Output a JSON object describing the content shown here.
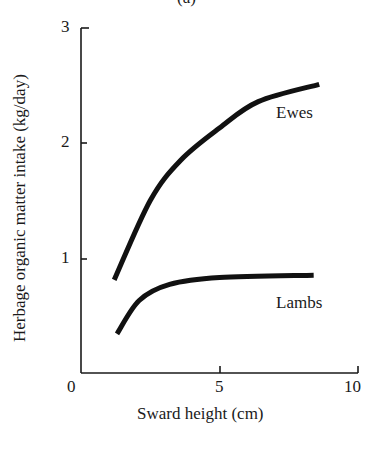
{
  "panel_label": "(a)",
  "chart_data": {
    "type": "line",
    "title": "",
    "xlabel": "Sward height (cm)",
    "ylabel": "Herbage organic matter intake (kg/day)",
    "xlim": [
      0,
      10
    ],
    "ylim": [
      0,
      3
    ],
    "xticks": [
      0,
      5,
      10
    ],
    "yticks": [
      0,
      1,
      2,
      3
    ],
    "grid": false,
    "legend": "inline labels next to curves",
    "series": [
      {
        "name": "Ewes",
        "x": [
          1.2,
          2.5,
          3.6,
          5.0,
          6.4,
          8.6
        ],
        "y": [
          0.81,
          1.5,
          1.85,
          2.13,
          2.36,
          2.51
        ]
      },
      {
        "name": "Lambs",
        "x": [
          1.3,
          2.1,
          3.2,
          5.0,
          8.4
        ],
        "y": [
          0.34,
          0.63,
          0.77,
          0.83,
          0.85
        ]
      }
    ]
  },
  "labels": {
    "xlabel": "Sward height (cm)",
    "ylabel": "Herbage organic matter intake (kg/day)",
    "x0": "0",
    "x5": "5",
    "x10": "10",
    "y1": "1",
    "y2": "2",
    "y3": "3",
    "ewes": "Ewes",
    "lambs": "Lambs"
  },
  "colors": {
    "ink": "#1a1a1a",
    "background": "#ffffff"
  }
}
